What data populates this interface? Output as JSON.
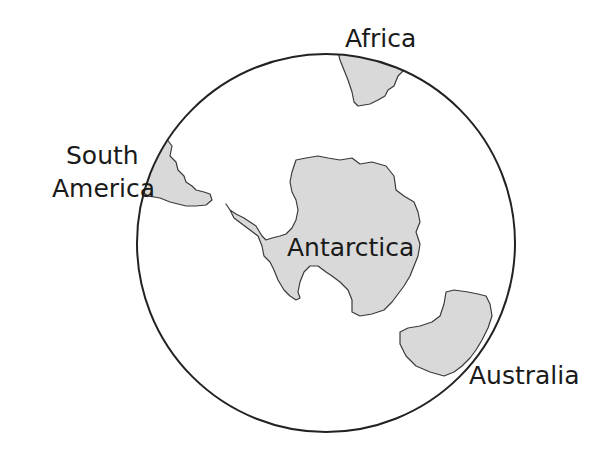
{
  "map": {
    "title": "",
    "projection": "south-polar-view",
    "colors": {
      "land": "#d9d9d9",
      "outline": "#3a3a3a",
      "globe_border": "#222222",
      "background": "#ffffff",
      "text": "#1a1a1a"
    },
    "labels": {
      "africa": "Africa",
      "south_america_line1": "South",
      "south_america_line2": "America",
      "antarctica": "Antarctica",
      "australia": "Australia"
    }
  }
}
